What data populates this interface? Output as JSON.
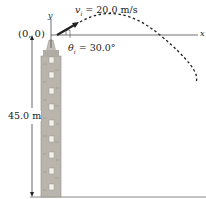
{
  "diagram": {
    "origin_label": "(0, 0)",
    "y_axis_label": "y",
    "x_axis_label": "x",
    "velocity_label": "v",
    "velocity_subscript": "i",
    "velocity_value": " = 20.0 m/s",
    "angle_label": "θ",
    "angle_subscript": "i",
    "angle_value": " = 30.0°",
    "height_label": "45.0 m"
  },
  "colors": {
    "tower": "#b9b5ad",
    "tower_dark": "#8f8a82",
    "window": "#f2f0ea",
    "line": "#222222",
    "ground": "#777777"
  }
}
